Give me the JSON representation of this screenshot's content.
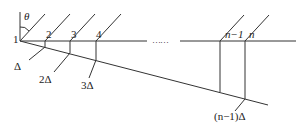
{
  "diagram": {
    "type": "geometric-construction",
    "stroke_color": "#333333",
    "angle_label": "θ",
    "point_labels": [
      "1",
      "2",
      "3",
      "4",
      "n−1",
      "n"
    ],
    "offset_labels": [
      "Δ",
      "2Δ",
      "3Δ",
      "(n−1)Δ"
    ],
    "ellipsis": "……"
  }
}
